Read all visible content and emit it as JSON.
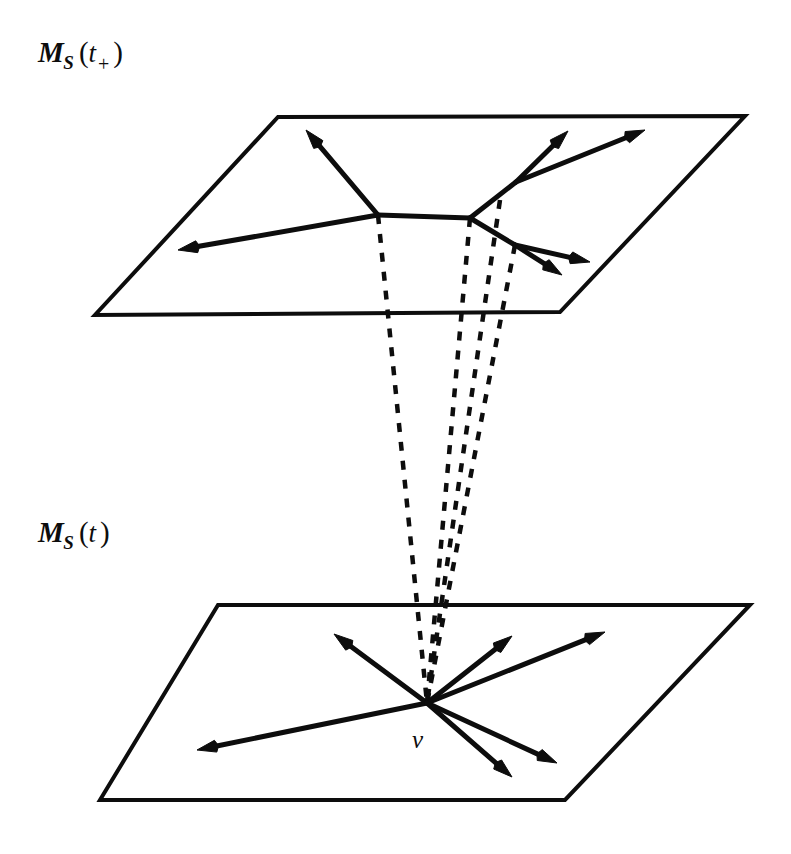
{
  "figure": {
    "background_color": "#ffffff",
    "ink_color": "#0d0d0d"
  },
  "labels": {
    "top_plane": {
      "name": "M_S(t_+)",
      "symbol": "M",
      "subscript": "S",
      "open_paren": "(",
      "argument": "t",
      "argument_subscript": "+",
      "close_paren": ")"
    },
    "bottom_plane": {
      "name": "M_S(t)",
      "symbol": "M",
      "subscript": "S",
      "open_paren": "(",
      "argument": "t",
      "close_paren": ")"
    },
    "vector_label": {
      "name": "v",
      "text": "v"
    }
  },
  "chart_data": {
    "type": "diagram",
    "planes": [
      {
        "id": "top-plane",
        "label": "M_S(t_+)",
        "corners": [
          [
            278,
            117
          ],
          [
            745,
            116
          ],
          [
            560,
            312
          ],
          [
            95,
            315
          ]
        ],
        "stroke_width": 4
      },
      {
        "id": "bottom-plane",
        "label": "M_S(t)",
        "corners": [
          [
            218,
            605
          ],
          [
            750,
            605
          ],
          [
            565,
            800
          ],
          [
            100,
            800
          ]
        ],
        "stroke_width": 4
      }
    ],
    "bottom_vertex": [
      427,
      703
    ],
    "bottom_vectors": [
      {
        "id": "v-up-left",
        "from": [
          427,
          703
        ],
        "to": [
          334,
          634
        ]
      },
      {
        "id": "v-up-right-near",
        "from": [
          427,
          703
        ],
        "to": [
          512,
          636
        ]
      },
      {
        "id": "v-up-right-far",
        "from": [
          427,
          703
        ],
        "to": [
          605,
          632
        ]
      },
      {
        "id": "v-left",
        "from": [
          427,
          703
        ],
        "to": [
          197,
          750
        ]
      },
      {
        "id": "v-down-right-near",
        "from": [
          427,
          703
        ],
        "to": [
          512,
          777
        ]
      },
      {
        "id": "v-down-right-far",
        "from": [
          427,
          703
        ],
        "to": [
          557,
          763
        ]
      }
    ],
    "top_branch_nodes": [
      {
        "id": "node-left",
        "point": [
          378,
          215
        ]
      },
      {
        "id": "node-right",
        "point": [
          470,
          218
        ]
      },
      {
        "id": "node-upper",
        "point": [
          516,
          182
        ]
      },
      {
        "id": "node-lower",
        "point": [
          515,
          245
        ]
      }
    ],
    "top_connectors": [
      {
        "id": "connector-horizontal",
        "from": [
          378,
          215
        ],
        "to": [
          470,
          218
        ]
      },
      {
        "id": "connector-upper",
        "from": [
          470,
          218
        ],
        "to": [
          516,
          182
        ]
      },
      {
        "id": "connector-lower",
        "from": [
          470,
          218
        ],
        "to": [
          515,
          245
        ]
      }
    ],
    "top_vectors": [
      {
        "id": "t-up-left",
        "from": [
          378,
          215
        ],
        "to": [
          306,
          130
        ]
      },
      {
        "id": "t-left",
        "from": [
          378,
          215
        ],
        "to": [
          178,
          250
        ]
      },
      {
        "id": "t-up-near",
        "from": [
          516,
          182
        ],
        "to": [
          568,
          131
        ]
      },
      {
        "id": "t-up-far",
        "from": [
          516,
          182
        ],
        "to": [
          645,
          130
        ]
      },
      {
        "id": "t-down-near",
        "from": [
          515,
          245
        ],
        "to": [
          562,
          275
        ]
      },
      {
        "id": "t-down-far",
        "from": [
          515,
          245
        ],
        "to": [
          590,
          262
        ]
      }
    ],
    "projection_lines": [
      {
        "id": "dash-left",
        "from": [
          378,
          215
        ],
        "to": [
          427,
          703
        ]
      },
      {
        "id": "dash-right",
        "from": [
          470,
          218
        ],
        "to": [
          427,
          703
        ]
      },
      {
        "id": "dash-upper",
        "from": [
          500,
          200
        ],
        "to": [
          427,
          703
        ]
      },
      {
        "id": "dash-lower",
        "from": [
          515,
          245
        ],
        "to": [
          427,
          703
        ]
      }
    ],
    "line_style": {
      "dash_pattern": "9 10",
      "dash_width": 4.5,
      "vector_width": 5,
      "arrowhead_length": 19,
      "arrowhead_halfwidth": 6
    }
  }
}
